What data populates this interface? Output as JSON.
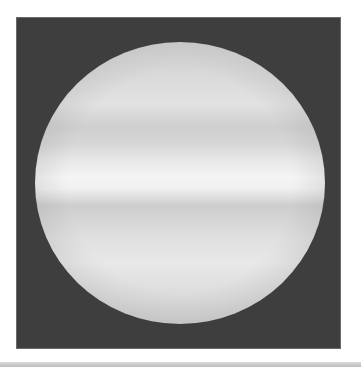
{
  "image": {
    "subject": "gas giant planet (banded disk) on dark background",
    "style": "grayscale",
    "colors": {
      "background": "#3e3e3e",
      "page": "#ffffff",
      "disk_light": "#f4f4f4",
      "disk_band": "#cfcfcf",
      "bottom_bar": "#c8c8c8"
    }
  }
}
